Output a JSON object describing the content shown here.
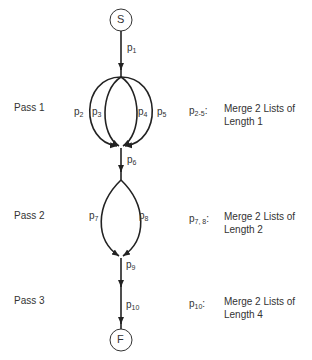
{
  "nodes": {
    "start": "S",
    "finish": "F"
  },
  "edges": [
    {
      "id": "p1",
      "base": "p",
      "sub": "1"
    },
    {
      "id": "p2",
      "base": "p",
      "sub": "2"
    },
    {
      "id": "p3",
      "base": "p",
      "sub": "3"
    },
    {
      "id": "p4",
      "base": "p",
      "sub": "4"
    },
    {
      "id": "p5",
      "base": "p",
      "sub": "5"
    },
    {
      "id": "p6",
      "base": "p",
      "sub": "6"
    },
    {
      "id": "p7",
      "base": "p",
      "sub": "7"
    },
    {
      "id": "p8",
      "base": "p",
      "sub": "8"
    },
    {
      "id": "p9",
      "base": "p",
      "sub": "9"
    },
    {
      "id": "p10",
      "base": "p",
      "sub": "10"
    }
  ],
  "passes": [
    {
      "label": "Pass 1",
      "key_base": "p",
      "key_sub": "2-5",
      "key_colon": ":",
      "desc_line1": "Merge 2 Lists of",
      "desc_line2": "Length 1"
    },
    {
      "label": "Pass 2",
      "key_base": "p",
      "key_sub": "7, 8",
      "key_colon": ":",
      "desc_line1": "Merge 2 Lists of",
      "desc_line2": "Length 2"
    },
    {
      "label": "Pass 3",
      "key_base": "p",
      "key_sub": "10",
      "key_colon": ":",
      "desc_line1": "Merge 2 Lists of",
      "desc_line2": "Length 4"
    }
  ],
  "colors": {
    "line": "#222222",
    "text": "#333333"
  }
}
